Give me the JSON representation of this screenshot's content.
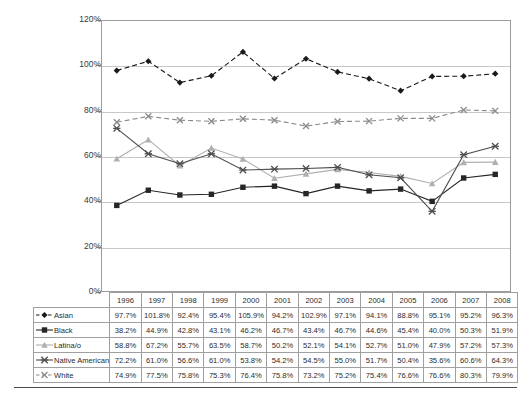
{
  "chart_data": {
    "type": "line",
    "title": "",
    "subtitle": "",
    "xlabel": "",
    "ylabel": "",
    "grid": true,
    "legend_position": "table-row-headers",
    "ylim": [
      0,
      120
    ],
    "ytick_labels": [
      "0%",
      "20%",
      "40%",
      "60%",
      "80%",
      "100%",
      "120%"
    ],
    "ytick_values": [
      0,
      20,
      40,
      60,
      80,
      100,
      120
    ],
    "categories": [
      "1996",
      "1997",
      "1998",
      "1999",
      "2000",
      "2001",
      "2002",
      "2003",
      "2004",
      "2005",
      "2006",
      "2007",
      "2008"
    ],
    "series": [
      {
        "name": "Asian",
        "marker": "diamond",
        "line_style": "dashed",
        "color": "#1a1a1a",
        "values": [
          97.7,
          101.8,
          92.4,
          95.4,
          105.9,
          94.2,
          102.9,
          97.1,
          94.1,
          88.8,
          95.1,
          95.2,
          96.3
        ],
        "labels": [
          "97.7%",
          "101.8%",
          "92.4%",
          "95.4%",
          "105.9%",
          "94.2%",
          "102.9%",
          "97.1%",
          "94.1%",
          "88.8%",
          "95.1%",
          "95.2%",
          "96.3%"
        ]
      },
      {
        "name": "Black",
        "marker": "square",
        "line_style": "solid",
        "color": "#262626",
        "values": [
          38.2,
          44.9,
          42.8,
          43.1,
          46.2,
          46.7,
          43.4,
          46.7,
          44.6,
          45.4,
          40.0,
          50.3,
          51.9
        ],
        "labels": [
          "38.2%",
          "44.9%",
          "42.8%",
          "43.1%",
          "46.2%",
          "46.7%",
          "43.4%",
          "46.7%",
          "44.6%",
          "45.4%",
          "40.0%",
          "50.3%",
          "51.9%"
        ]
      },
      {
        "name": "Latina/o",
        "marker": "triangle",
        "line_style": "solid",
        "color": "#b0b0b0",
        "values": [
          58.8,
          67.2,
          55.7,
          63.5,
          58.7,
          50.2,
          52.1,
          54.1,
          52.7,
          51.0,
          47.9,
          57.2,
          57.3
        ],
        "labels": [
          "58.8%",
          "67.2%",
          "55.7%",
          "63.5%",
          "58.7%",
          "50.2%",
          "52.1%",
          "54.1%",
          "52.7%",
          "51.0%",
          "47.9%",
          "57.2%",
          "57.3%"
        ]
      },
      {
        "name": "Native American",
        "marker": "star",
        "line_style": "solid",
        "color": "#4d4d4d",
        "values": [
          72.2,
          61.0,
          56.6,
          61.0,
          53.8,
          54.2,
          54.5,
          55.0,
          51.7,
          50.4,
          35.6,
          60.6,
          64.3
        ],
        "labels": [
          "72.2%",
          "61.0%",
          "56.6%",
          "61.0%",
          "53.8%",
          "54.2%",
          "54.5%",
          "55.0%",
          "51.7%",
          "50.4%",
          "35.6%",
          "60.6%",
          "64.3%"
        ]
      },
      {
        "name": "White",
        "marker": "x",
        "line_style": "dashed",
        "color": "#8a8a8a",
        "values": [
          74.9,
          77.5,
          75.8,
          75.3,
          76.4,
          75.8,
          73.2,
          75.2,
          75.4,
          76.6,
          76.6,
          80.3,
          79.9
        ],
        "labels": [
          "74.9%",
          "77.5%",
          "75.8%",
          "75.3%",
          "76.4%",
          "75.8%",
          "73.2%",
          "75.2%",
          "75.4%",
          "76.6%",
          "76.6%",
          "80.3%",
          "79.9%"
        ]
      }
    ]
  },
  "table": {
    "corner_label": "",
    "column_headers": [
      "1996",
      "1997",
      "1998",
      "1999",
      "2000",
      "2001",
      "2002",
      "2003",
      "2004",
      "2005",
      "2006",
      "2007",
      "2008"
    ],
    "rows": [
      {
        "label": "Asian",
        "cells": [
          "97.7%",
          "101.8%",
          "92.4%",
          "95.4%",
          "105.9%",
          "94.2%",
          "102.9%",
          "97.1%",
          "94.1%",
          "88.8%",
          "95.1%",
          "95.2%",
          "96.3%"
        ]
      },
      {
        "label": "Black",
        "cells": [
          "38.2%",
          "44.9%",
          "42.8%",
          "43.1%",
          "46.2%",
          "46.7%",
          "43.4%",
          "46.7%",
          "44.6%",
          "45.4%",
          "40.0%",
          "50.3%",
          "51.9%"
        ]
      },
      {
        "label": "Latina/o",
        "cells": [
          "58.8%",
          "67.2%",
          "55.7%",
          "63.5%",
          "58.7%",
          "50.2%",
          "52.1%",
          "54.1%",
          "52.7%",
          "51.0%",
          "47.9%",
          "57.2%",
          "57.3%"
        ]
      },
      {
        "label": "Native American",
        "cells": [
          "72.2%",
          "61.0%",
          "56.6%",
          "61.0%",
          "53.8%",
          "54.2%",
          "54.5%",
          "55.0%",
          "51.7%",
          "50.4%",
          "35.6%",
          "60.6%",
          "64.3%"
        ]
      },
      {
        "label": "White",
        "cells": [
          "74.9%",
          "77.5%",
          "75.8%",
          "75.3%",
          "76.4%",
          "75.8%",
          "73.2%",
          "75.2%",
          "75.4%",
          "76.6%",
          "76.6%",
          "80.3%",
          "79.9%"
        ]
      }
    ]
  },
  "colors": {
    "asian": "#1a1a1a",
    "black": "#262626",
    "latina_o": "#b0b0b0",
    "native_american": "#4d4d4d",
    "white": "#8a8a8a",
    "gridline": "#c8c8c8",
    "frame": "#9b9b9b"
  }
}
